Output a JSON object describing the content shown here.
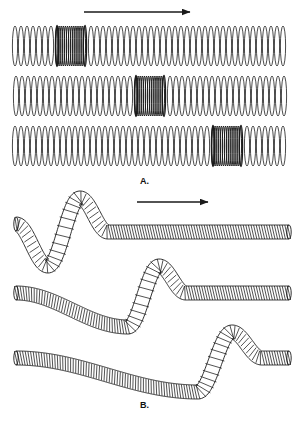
{
  "figure": {
    "background_color": "#ffffff",
    "ink_color": "#1a1a1a",
    "width": 297,
    "height": 426
  },
  "panels": [
    {
      "id": "A",
      "label": "A.",
      "wave_type": "longitudinal",
      "description": "Compressional (longitudinal) wave pulse travelling right along a coiled spring; three successive snapshots in time.",
      "arrow": {
        "name": "propagation-direction-arrow",
        "label": "direction of wave travel",
        "x1": 84,
        "y1": 12,
        "x2": 190,
        "y2": 12
      },
      "snapshots": [
        {
          "index": 1,
          "time_label": "t1",
          "axis_y": 46,
          "spring_x1": 14,
          "spring_x2": 288,
          "coil_half_height": 20,
          "coil_count": 40,
          "compression_center_x": 71,
          "compression_half_width": 14,
          "compression_coil_count": 13
        },
        {
          "index": 2,
          "time_label": "t2",
          "axis_y": 96,
          "spring_x1": 14,
          "spring_x2": 288,
          "coil_half_height": 20,
          "coil_count": 40,
          "compression_center_x": 150,
          "compression_half_width": 14,
          "compression_coil_count": 13
        },
        {
          "index": 3,
          "time_label": "t3",
          "axis_y": 146,
          "spring_x1": 14,
          "spring_x2": 288,
          "coil_half_height": 20,
          "coil_count": 40,
          "compression_center_x": 227,
          "compression_half_width": 14,
          "compression_coil_count": 13
        }
      ]
    },
    {
      "id": "B",
      "label": "B.",
      "wave_type": "transverse",
      "description": "Transverse wave pulse travelling right along a coiled spring; three successive snapshots in time.",
      "arrow": {
        "name": "propagation-direction-arrow",
        "label": "direction of wave travel",
        "x1": 137,
        "y1": 202,
        "x2": 208,
        "y2": 202
      },
      "snapshots": [
        {
          "index": 1,
          "time_label": "t1",
          "baseline_y": 232,
          "spring_x1": 16,
          "spring_x2": 289,
          "tube_half_height": 7,
          "start_y": 224,
          "trough_x": 48,
          "trough_y": 266,
          "crest_x": 80,
          "crest_y": 198,
          "settle_x": 108
        },
        {
          "index": 2,
          "time_label": "t2",
          "baseline_y": 293,
          "spring_x1": 16,
          "spring_x2": 289,
          "tube_half_height": 7,
          "start_y": 293,
          "trough_x": 128,
          "trough_y": 327,
          "crest_x": 159,
          "crest_y": 266,
          "settle_x": 186
        },
        {
          "index": 3,
          "time_label": "t3",
          "baseline_y": 358,
          "spring_x1": 16,
          "spring_x2": 289,
          "tube_half_height": 7,
          "start_y": 358,
          "trough_x": 198,
          "trough_y": 392,
          "crest_x": 232,
          "crest_y": 332,
          "settle_x": 262
        }
      ]
    }
  ]
}
